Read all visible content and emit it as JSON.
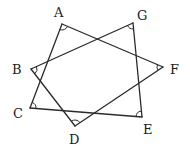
{
  "diagram": {
    "type": "seven-pointed star (heptagram)",
    "colors": {
      "stroke": "#2a2a2a",
      "text": "#222222",
      "background": "#ffffff"
    },
    "vertices": [
      {
        "id": "A",
        "label": "A",
        "x": 62,
        "y": 24,
        "lx": 54,
        "ly": 17
      },
      {
        "id": "B",
        "label": "B",
        "x": 31,
        "y": 69,
        "lx": 12,
        "ly": 74
      },
      {
        "id": "C",
        "label": "C",
        "x": 30,
        "y": 108,
        "lx": 13,
        "ly": 118
      },
      {
        "id": "D",
        "label": "D",
        "x": 75,
        "y": 126,
        "lx": 69,
        "ly": 144
      },
      {
        "id": "E",
        "label": "E",
        "x": 142,
        "y": 117,
        "lx": 143,
        "ly": 134
      },
      {
        "id": "F",
        "label": "F",
        "x": 163,
        "y": 67,
        "lx": 170,
        "ly": 74
      },
      {
        "id": "G",
        "label": "G",
        "x": 133,
        "y": 23,
        "lx": 137,
        "ly": 20
      }
    ],
    "edges": [
      [
        "A",
        "C"
      ],
      [
        "A",
        "F"
      ],
      [
        "B",
        "D"
      ],
      [
        "B",
        "G"
      ],
      [
        "C",
        "E"
      ],
      [
        "D",
        "F"
      ],
      [
        "E",
        "G"
      ]
    ],
    "angle_marks": [
      "A",
      "B",
      "C",
      "D",
      "E",
      "F",
      "G"
    ]
  }
}
